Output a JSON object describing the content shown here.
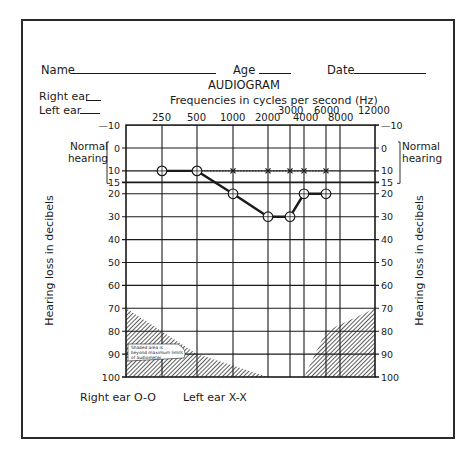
{
  "form": {
    "name_label": "Name",
    "age_label": "Age",
    "date_label": "Date",
    "right_ear_label": "Right ear",
    "left_ear_label": "Left ear"
  },
  "legend": {
    "right_ear": "Right ear O-O",
    "left_ear": "Left ear X-X"
  },
  "chart_data": {
    "type": "line",
    "title": "AUDIOGRAM",
    "xlabel": "Frequencies in cycles per second (Hz)",
    "ylabel": "Hearing loss in decibels",
    "x_tick_labels_row1": [
      "3000",
      "6000",
      "12000"
    ],
    "x_tick_labels_row2": [
      "250",
      "500",
      "1000",
      "2000",
      "4000",
      "8000"
    ],
    "x": [
      250,
      500,
      1000,
      2000,
      3000,
      4000,
      6000,
      8000
    ],
    "y_ticks": [
      -10,
      0,
      10,
      15,
      20,
      30,
      40,
      50,
      60,
      70,
      80,
      90,
      100
    ],
    "ylim": [
      -10,
      100
    ],
    "y_inverted": true,
    "grid": true,
    "normal_hearing_label": "Normal hearing",
    "normal_hearing_range": [
      0,
      15
    ],
    "series": [
      {
        "name": "Right ear",
        "marker": "O",
        "x": [
          250,
          500,
          1000,
          2000,
          3000,
          4000,
          6000
        ],
        "values": [
          10,
          10,
          20,
          30,
          30,
          20,
          20
        ]
      },
      {
        "name": "Left ear",
        "marker": "X",
        "x": [
          250,
          500,
          1000,
          2000,
          3000,
          4000,
          6000
        ],
        "values": [
          10,
          10,
          10,
          10,
          10,
          10,
          10
        ]
      }
    ],
    "annotation": "Shaded area is beyond maximum limits of audiometer"
  }
}
